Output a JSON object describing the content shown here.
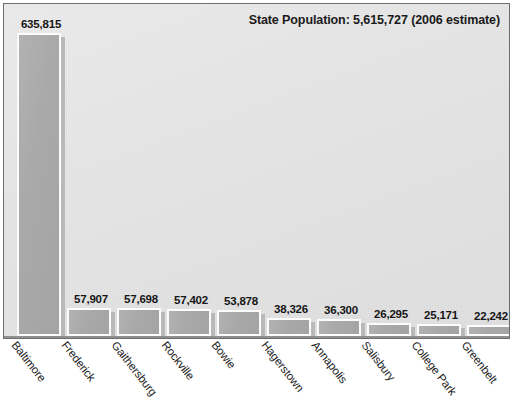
{
  "chart_data": {
    "type": "bar",
    "title": "State Population: 5,615,727 (2006 estimate)",
    "xlabel": "",
    "ylabel": "",
    "ylim": [
      0,
      700000
    ],
    "grid": false,
    "legend": "none",
    "categories": [
      "Baltimore",
      "Frederick",
      "Gaithersburg",
      "Rockville",
      "Bowie",
      "Hagerstown",
      "Annapolis",
      "Salisbury",
      "College Park",
      "Greenbelt"
    ],
    "values": [
      635815,
      57907,
      57698,
      57402,
      53878,
      38326,
      36300,
      26295,
      25171,
      22242
    ],
    "value_labels": [
      "635,815",
      "57,907",
      "57,698",
      "57,402",
      "53,878",
      "38,326",
      "36,300",
      "26,295",
      "25,171",
      "22,242"
    ],
    "colors": {
      "bar_fill": "#a9a9a9",
      "bar_border": "#fcfcfc",
      "bar_shadow": "#b9b9b9",
      "plot_background": "#e7e7e7",
      "frame_border": "#6e6e6e",
      "axis_line": "#8f8f8f",
      "text": "#1a1a1a"
    }
  },
  "figure": {
    "title": "State Population: 5,615,727 (2006 estimate)"
  }
}
